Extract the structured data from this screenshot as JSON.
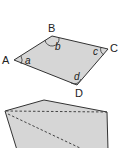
{
  "figure1": {
    "vertices": [
      "A",
      "B",
      "C",
      "D"
    ],
    "angles": [
      "a",
      "b",
      "c",
      "d"
    ],
    "fill_color": "#d6d6d6",
    "stroke_color": "#333333"
  },
  "figure2": {
    "fill_color": "#d6d6d6",
    "stroke_color": "#333333",
    "diagonals_style": "dashed"
  }
}
